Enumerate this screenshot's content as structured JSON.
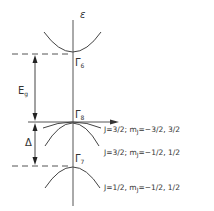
{
  "diagram": {
    "type": "band-structure",
    "axis_label": "ε",
    "levels": [
      {
        "name": "Γ",
        "sub": "6"
      },
      {
        "name": "Γ",
        "sub": "8"
      },
      {
        "name": "Γ",
        "sub": "7"
      }
    ],
    "gaps": [
      {
        "name": "E",
        "sub": "g"
      },
      {
        "name": "Δ"
      }
    ],
    "bands": [
      {
        "label": "J=3/2; m",
        "sub": "J",
        "rest": "=−3/2, 3/2"
      },
      {
        "label": "J=3/2; m",
        "sub": "J",
        "rest": "=−1/2, 1/2"
      },
      {
        "label": "J=1/2, m",
        "sub": "J",
        "rest": "=−1/2, 1/2"
      }
    ],
    "stroke_color": "#444444"
  }
}
